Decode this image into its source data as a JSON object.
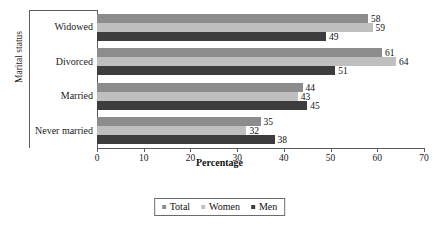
{
  "chart_data": {
    "type": "bar",
    "orientation": "horizontal",
    "title": "",
    "xlabel": "Percentage",
    "ylabel": "Marital status",
    "categories": [
      "Widowed",
      "Divorced",
      "Married",
      "Never married"
    ],
    "series": [
      {
        "name": "Total",
        "color": "#8c8c8c",
        "values": [
          58,
          61,
          44,
          35
        ]
      },
      {
        "name": "Women",
        "color": "#bfbfbf",
        "values": [
          59,
          64,
          43,
          32
        ]
      },
      {
        "name": "Men",
        "color": "#3d3d3d",
        "values": [
          49,
          51,
          45,
          38
        ]
      }
    ],
    "xlim": [
      0,
      70
    ],
    "xticks": [
      0,
      10,
      20,
      30,
      40,
      50,
      60,
      70
    ],
    "xtick_labels": [
      "0",
      "10",
      "20",
      "30",
      "40",
      "50",
      "60",
      "70"
    ],
    "grid": false,
    "legend_position": "bottom",
    "data_labels": true
  },
  "legend": {
    "items": [
      {
        "label": "Total",
        "swatch": "total"
      },
      {
        "label": "Women",
        "swatch": "women"
      },
      {
        "label": "Men",
        "swatch": "men"
      }
    ]
  }
}
